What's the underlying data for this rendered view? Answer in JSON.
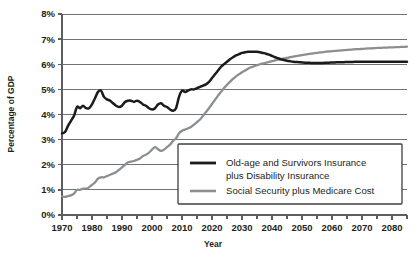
{
  "chart_data": {
    "type": "line",
    "title": "",
    "xlabel": "Year",
    "ylabel": "Percentage of GDP",
    "xlim": [
      1970,
      2085
    ],
    "ylim": [
      0,
      8
    ],
    "grid": true,
    "legend_position": "bottom-right-inside",
    "y_tick_labels": [
      "0%",
      "1%",
      "2%",
      "3%",
      "4%",
      "5%",
      "6%",
      "7%",
      "8%"
    ],
    "y_tick_values": [
      0,
      1,
      2,
      3,
      4,
      5,
      6,
      7,
      8
    ],
    "x_tick_labels": [
      "1970",
      "1980",
      "1990",
      "2000",
      "2010",
      "2020",
      "2030",
      "2040",
      "2050",
      "2060",
      "2070",
      "2080"
    ],
    "x_tick_values": [
      1970,
      1980,
      1990,
      2000,
      2010,
      2020,
      2030,
      2040,
      2050,
      2060,
      2070,
      2080
    ],
    "x_minor_tick_values": [
      1975,
      1985,
      1995,
      2005,
      2015,
      2025,
      2035,
      2045,
      2055,
      2065,
      2075,
      2085
    ],
    "series": [
      {
        "name": "Old-age and Survivors Insurance plus Disability Insurance",
        "color": "#1b1b1b",
        "x": [
          1970,
          1971,
          1972,
          1973,
          1974,
          1975,
          1976,
          1977,
          1978,
          1979,
          1980,
          1981,
          1982,
          1983,
          1984,
          1985,
          1986,
          1987,
          1988,
          1989,
          1990,
          1991,
          1992,
          1993,
          1994,
          1995,
          1996,
          1997,
          1998,
          1999,
          2000,
          2001,
          2002,
          2003,
          2004,
          2005,
          2006,
          2007,
          2008,
          2009,
          2010,
          2011,
          2012,
          2013,
          2014,
          2015,
          2016,
          2017,
          2018,
          2019,
          2020,
          2021,
          2022,
          2023,
          2024,
          2025,
          2026,
          2027,
          2028,
          2029,
          2030,
          2031,
          2032,
          2033,
          2034,
          2035,
          2036,
          2037,
          2038,
          2039,
          2040,
          2041,
          2042,
          2043,
          2044,
          2045,
          2046,
          2047,
          2048,
          2049,
          2050,
          2051,
          2052,
          2053,
          2054,
          2055,
          2056,
          2057,
          2058,
          2059,
          2060,
          2061,
          2062,
          2063,
          2064,
          2065,
          2066,
          2067,
          2068,
          2069,
          2070,
          2071,
          2072,
          2073,
          2074,
          2075,
          2076,
          2077,
          2078,
          2079,
          2080,
          2081,
          2082,
          2083,
          2084,
          2085
        ],
        "y": [
          3.25,
          3.3,
          3.55,
          3.75,
          3.95,
          4.3,
          4.25,
          4.35,
          4.25,
          4.25,
          4.4,
          4.65,
          4.9,
          4.95,
          4.7,
          4.6,
          4.55,
          4.45,
          4.35,
          4.3,
          4.35,
          4.5,
          4.55,
          4.55,
          4.5,
          4.55,
          4.5,
          4.4,
          4.35,
          4.25,
          4.2,
          4.25,
          4.4,
          4.45,
          4.35,
          4.3,
          4.2,
          4.15,
          4.25,
          4.7,
          4.95,
          4.9,
          4.95,
          5.0,
          5.0,
          5.05,
          5.1,
          5.15,
          5.2,
          5.3,
          5.45,
          5.6,
          5.75,
          5.9,
          6.0,
          6.1,
          6.2,
          6.28,
          6.35,
          6.4,
          6.45,
          6.48,
          6.5,
          6.5,
          6.5,
          6.5,
          6.48,
          6.45,
          6.42,
          6.38,
          6.33,
          6.28,
          6.24,
          6.2,
          6.17,
          6.14,
          6.12,
          6.1,
          6.09,
          6.08,
          6.07,
          6.06,
          6.06,
          6.05,
          6.05,
          6.05,
          6.05,
          6.05,
          6.06,
          6.06,
          6.07,
          6.07,
          6.08,
          6.08,
          6.08,
          6.09,
          6.09,
          6.09,
          6.1,
          6.1,
          6.1,
          6.1,
          6.1,
          6.1,
          6.1,
          6.1,
          6.1,
          6.1,
          6.1,
          6.1,
          6.1,
          6.1,
          6.1,
          6.1,
          6.1,
          6.1
        ]
      },
      {
        "name": "Social Security plus Medicare Cost",
        "color": "#8a8f93",
        "x": [
          1970,
          1971,
          1972,
          1973,
          1974,
          1975,
          1976,
          1977,
          1978,
          1979,
          1980,
          1981,
          1982,
          1983,
          1984,
          1985,
          1986,
          1987,
          1988,
          1989,
          1990,
          1991,
          1992,
          1993,
          1994,
          1995,
          1996,
          1997,
          1998,
          1999,
          2000,
          2001,
          2002,
          2003,
          2004,
          2005,
          2006,
          2007,
          2008,
          2009,
          2010,
          2011,
          2012,
          2013,
          2014,
          2015,
          2016,
          2017,
          2018,
          2019,
          2020,
          2021,
          2022,
          2023,
          2024,
          2025,
          2026,
          2027,
          2028,
          2029,
          2030,
          2031,
          2032,
          2033,
          2034,
          2035,
          2036,
          2037,
          2038,
          2039,
          2040,
          2041,
          2042,
          2043,
          2044,
          2045,
          2046,
          2047,
          2048,
          2049,
          2050,
          2051,
          2052,
          2053,
          2054,
          2055,
          2056,
          2057,
          2058,
          2059,
          2060,
          2061,
          2062,
          2063,
          2064,
          2065,
          2066,
          2067,
          2068,
          2069,
          2070,
          2071,
          2072,
          2073,
          2074,
          2075,
          2076,
          2077,
          2078,
          2079,
          2080,
          2081,
          2082,
          2083,
          2084,
          2085
        ],
        "y": [
          0.75,
          0.72,
          0.75,
          0.78,
          0.85,
          1.0,
          1.0,
          1.05,
          1.05,
          1.1,
          1.2,
          1.3,
          1.45,
          1.5,
          1.5,
          1.55,
          1.6,
          1.65,
          1.7,
          1.8,
          1.9,
          2.0,
          2.1,
          2.12,
          2.15,
          2.2,
          2.25,
          2.35,
          2.4,
          2.48,
          2.6,
          2.7,
          2.62,
          2.55,
          2.6,
          2.7,
          2.8,
          2.95,
          3.05,
          3.25,
          3.35,
          3.4,
          3.45,
          3.5,
          3.6,
          3.7,
          3.8,
          3.95,
          4.1,
          4.25,
          4.42,
          4.58,
          4.75,
          4.9,
          5.05,
          5.18,
          5.3,
          5.42,
          5.52,
          5.6,
          5.68,
          5.75,
          5.82,
          5.88,
          5.92,
          5.96,
          6.0,
          6.03,
          6.06,
          6.09,
          6.12,
          6.15,
          6.18,
          6.2,
          6.23,
          6.25,
          6.28,
          6.3,
          6.32,
          6.34,
          6.36,
          6.38,
          6.4,
          6.42,
          6.44,
          6.45,
          6.47,
          6.48,
          6.5,
          6.51,
          6.52,
          6.53,
          6.54,
          6.55,
          6.56,
          6.57,
          6.58,
          6.59,
          6.6,
          6.6,
          6.61,
          6.62,
          6.63,
          6.63,
          6.64,
          6.65,
          6.65,
          6.66,
          6.66,
          6.67,
          6.67,
          6.68,
          6.68,
          6.69,
          6.69,
          6.7
        ]
      }
    ],
    "legend_entries": [
      {
        "label_line1": "Old-age and Survivors Insurance",
        "label_line2": "plus Disability Insurance",
        "color": "#1b1b1b"
      },
      {
        "label_line1": "Social Security plus Medicare Cost",
        "label_line2": "",
        "color": "#8a8f93"
      }
    ]
  },
  "colors": {
    "background": "#ffffff",
    "gridline": "#6f7376",
    "axis": "#5b5f62",
    "text": "#231f20",
    "series_oasdi": "#1b1b1b",
    "series_ssmed": "#8a8f93"
  }
}
